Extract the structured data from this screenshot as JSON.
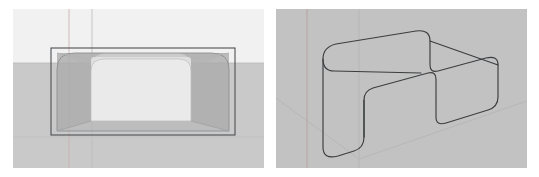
{
  "page": {
    "width": 539,
    "height": 177,
    "background_color": "#ffffff",
    "panel_count": 2
  },
  "palette": {
    "page_background": "#ffffff",
    "left_sky": "#f1f1f1",
    "left_ground": "#c9c9c9",
    "right_background": "#c2c2c2",
    "wire_dark": "#4d4f52",
    "outline_dark": "#3b3d3f",
    "axis_red": "#c8a8a8",
    "axis_green": "#a8bba8",
    "axis_grey": "#b0b0b0",
    "solid_fill": "#a8a8a8",
    "solid_fill_light": "#e6e6e6",
    "highlight_face": "#ededed"
  },
  "panels": [
    {
      "id": "left-viewport",
      "name": "left-viewport",
      "caption": "Rounded box solid with wireframe bounding box",
      "view": "front-perspective",
      "geometry_type": "rounded-box",
      "x": 13,
      "y": 9,
      "width": 251,
      "height": 159,
      "horizon_y": 54,
      "sky_color": "#f1f1f1",
      "ground_color": "#c9c9c9",
      "bounding_box": {
        "left": 38,
        "top": 39,
        "right": 222,
        "bottom": 126,
        "stroke": "#4d4f52"
      },
      "solid": {
        "corner_radius": 22,
        "front_face_color": "#ededed",
        "side_face_color": "#a9a9a9",
        "opacity": 0.85
      },
      "axes": [
        {
          "name": "vertical-axis-red",
          "orientation": "vertical",
          "position": 56,
          "color": "#c9aeae"
        },
        {
          "name": "vertical-axis-grey",
          "orientation": "vertical",
          "position": 79,
          "color": "#bdbdbd"
        },
        {
          "name": "horizon-line",
          "orientation": "horizontal",
          "position": 54,
          "color": "#b9b9b9"
        }
      ]
    },
    {
      "id": "right-viewport",
      "name": "right-viewport",
      "caption": "U-channel sheet metal part outline in perspective",
      "view": "three-quarter-perspective",
      "geometry_type": "u-channel",
      "x": 276,
      "y": 9,
      "width": 251,
      "height": 159,
      "background_color": "#c2c2c2",
      "outline_color": "#3b3d3f",
      "outline_width": 1.15,
      "axes": [
        {
          "name": "vertical-axis-red",
          "orientation": "vertical",
          "position": 31,
          "color": "#b79c9c"
        },
        {
          "name": "vertical-axis-grey",
          "orientation": "vertical",
          "position": 83,
          "color": "#b4b4b4"
        },
        {
          "name": "ground-axis-left",
          "orientation": "diagonal",
          "color": "#b4b4b4"
        },
        {
          "name": "ground-axis-right",
          "orientation": "diagonal",
          "color": "#b4b4b4"
        }
      ],
      "profile": {
        "corner_radius": 17,
        "flange_count": 2,
        "web_present": true
      }
    }
  ],
  "gap": {
    "name": "panel-gap",
    "between_x_start": 264,
    "between_x_end": 276,
    "color": "#ffffff",
    "width": 12
  }
}
